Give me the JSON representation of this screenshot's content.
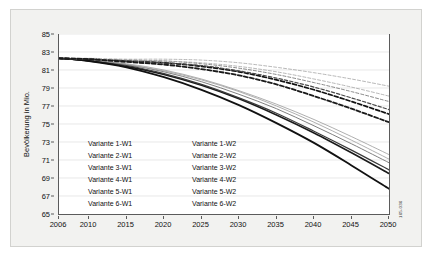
{
  "chart_data": {
    "type": "line",
    "title": "",
    "xlabel": "",
    "ylabel": "Bevölkerung in Mio.",
    "xlim": [
      2006,
      2050
    ],
    "ylim": [
      65,
      85
    ],
    "ytick_step": 2,
    "grid": true,
    "legend_position": "inside-lower-left",
    "x_ticks": [
      "2006",
      "2010",
      "2015",
      "2020",
      "2025",
      "2030",
      "2035",
      "2040",
      "2045",
      "2050"
    ],
    "x_tick_values": [
      2006,
      2010,
      2015,
      2020,
      2025,
      2030,
      2035,
      2040,
      2045,
      2050
    ],
    "y_ticks": [
      "65",
      "67",
      "69",
      "71",
      "73",
      "75",
      "77",
      "79",
      "81",
      "83",
      "85"
    ],
    "y_tick_values": [
      65,
      67,
      69,
      71,
      73,
      75,
      77,
      79,
      81,
      83,
      85
    ],
    "x": [
      2006,
      2010,
      2015,
      2020,
      2025,
      2030,
      2035,
      2040,
      2045,
      2050
    ],
    "series": [
      {
        "name": "Variante 1-W1",
        "style": "solid",
        "width": 0.7,
        "color": "#8c8c8c",
        "values": [
          82.3,
          82.1,
          81.7,
          81.0,
          80.0,
          78.7,
          77.2,
          75.5,
          73.6,
          71.6
        ]
      },
      {
        "name": "Variante 2-W1",
        "style": "solid",
        "width": 0.9,
        "color": "#707070",
        "values": [
          82.3,
          82.1,
          81.6,
          80.8,
          79.7,
          78.3,
          76.7,
          74.8,
          72.8,
          70.7
        ]
      },
      {
        "name": "Variante 3-W1",
        "style": "solid",
        "width": 1.6,
        "color": "#1a1a1a",
        "values": [
          82.3,
          82.0,
          81.4,
          80.5,
          79.3,
          77.8,
          76.0,
          74.0,
          71.8,
          69.5
        ]
      },
      {
        "name": "Variante 4-W1",
        "style": "solid",
        "width": 0.8,
        "color": "#9a9a9a",
        "values": [
          82.3,
          82.1,
          81.6,
          80.9,
          79.9,
          78.6,
          77.0,
          75.2,
          73.2,
          71.1
        ]
      },
      {
        "name": "Variante 5-W1",
        "style": "solid",
        "width": 1.2,
        "color": "#3a3a3a",
        "values": [
          82.3,
          82.0,
          81.5,
          80.6,
          79.4,
          77.9,
          76.2,
          74.2,
          72.1,
          69.9
        ]
      },
      {
        "name": "Variante 6-W1",
        "style": "solid",
        "width": 1.8,
        "color": "#111111",
        "values": [
          82.3,
          82.0,
          81.3,
          80.2,
          78.8,
          77.1,
          75.1,
          72.9,
          70.4,
          67.8
        ]
      },
      {
        "name": "Variante 1-W2",
        "style": "dashed",
        "width": 0.7,
        "color": "#9a9a9a",
        "values": [
          82.3,
          82.3,
          82.2,
          82.2,
          82.1,
          81.8,
          81.3,
          80.7,
          80.0,
          79.2
        ]
      },
      {
        "name": "Variante 2-W2",
        "style": "dashed",
        "width": 0.9,
        "color": "#7a7a7a",
        "values": [
          82.3,
          82.2,
          82.1,
          82.0,
          81.7,
          81.2,
          80.5,
          79.6,
          78.6,
          77.5
        ]
      },
      {
        "name": "Variante 3-W2",
        "style": "dashed",
        "width": 1.7,
        "color": "#111111",
        "values": [
          82.3,
          82.2,
          82.0,
          81.8,
          81.4,
          80.8,
          79.9,
          78.8,
          77.5,
          76.1
        ]
      },
      {
        "name": "Variante 4-W2",
        "style": "dashed",
        "width": 0.8,
        "color": "#a5a5a5",
        "values": [
          82.3,
          82.2,
          82.1,
          82.0,
          81.8,
          81.4,
          80.8,
          80.0,
          79.1,
          78.1
        ]
      },
      {
        "name": "Variante 5-W2",
        "style": "dashed",
        "width": 1.2,
        "color": "#4a4a4a",
        "values": [
          82.3,
          82.2,
          82.0,
          81.8,
          81.5,
          80.9,
          80.1,
          79.1,
          77.9,
          76.6
        ]
      },
      {
        "name": "Variante 6-W2",
        "style": "dashed",
        "width": 1.8,
        "color": "#1a1a1a",
        "values": [
          82.3,
          82.2,
          81.9,
          81.6,
          81.1,
          80.4,
          79.4,
          78.1,
          76.7,
          75.2
        ]
      }
    ],
    "legend_entries": [
      "Variante 1-W1",
      "Variante 1-W2",
      "Variante 2-W1",
      "Variante 2-W2",
      "Variante 3-W1",
      "Variante 3-W2",
      "Variante 4-W1",
      "Variante 4-W2",
      "Variante 5-W1",
      "Variante 5-W2",
      "Variante 6-W1",
      "Variante 6-W2"
    ]
  },
  "annotations": {
    "source_code": "165-036"
  },
  "colors": {
    "frame_background": "#f2f2f0",
    "plot_background": "#ffffff",
    "axis": "#5b5b5b",
    "grid": "#d9d9d9",
    "text": "#111111"
  }
}
